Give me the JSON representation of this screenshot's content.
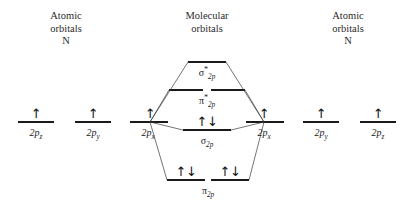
{
  "diagram": {
    "type": "molecular-orbital-correlation-diagram",
    "line_color": "#1a1a1a",
    "background_color": "#ffffff",
    "electron_up": "↑",
    "electron_pair": "↑↓"
  },
  "headings": {
    "left": "Atomic\norbitals\nN",
    "center": "Molecular\norbitals",
    "right": "Atomic\norbitals\nN"
  },
  "atomic_levels": {
    "left": [
      {
        "label_base": "2p",
        "label_sub": "z",
        "electrons": "↑",
        "x": 36,
        "y": 122
      },
      {
        "label_base": "2p",
        "label_sub": "y",
        "electrons": "↑",
        "x": 93,
        "y": 122
      },
      {
        "label_base": "2p",
        "label_sub": "x",
        "electrons": "↑",
        "x": 150,
        "y": 122
      }
    ],
    "right": [
      {
        "label_base": "2p",
        "label_sub": "x",
        "electrons": "↑",
        "x": 264,
        "y": 122
      },
      {
        "label_base": "2p",
        "label_sub": "y",
        "electrons": "↑",
        "x": 321,
        "y": 122
      },
      {
        "label_base": "2p",
        "label_sub": "z",
        "electrons": "↑",
        "x": 378,
        "y": 122
      }
    ]
  },
  "molecular_levels": [
    {
      "name": "sigma-2p-antibonding",
      "greek": "σ",
      "star": "*",
      "sub": "2p",
      "electrons": "",
      "y": 62,
      "segments": [
        {
          "x": 207,
          "width": 38
        }
      ]
    },
    {
      "name": "pi-2p-antibonding",
      "greek": "π",
      "star": "*",
      "sub": "2p",
      "electrons": "",
      "y": 90,
      "segments": [
        {
          "x": 186,
          "width": 34
        },
        {
          "x": 228,
          "width": 34
        }
      ]
    },
    {
      "name": "sigma-2p-bonding",
      "greek": "σ",
      "star": "",
      "sub": "2p",
      "electrons": "↑↓",
      "y": 130,
      "segments": [
        {
          "x": 207,
          "width": 48
        }
      ]
    },
    {
      "name": "pi-2p-bonding",
      "greek": "π",
      "star": "",
      "sub": "2p",
      "electrons": "↑↓",
      "y": 180,
      "segments": [
        {
          "x": 186,
          "width": 38
        },
        {
          "x": 230,
          "width": 38
        }
      ]
    }
  ]
}
